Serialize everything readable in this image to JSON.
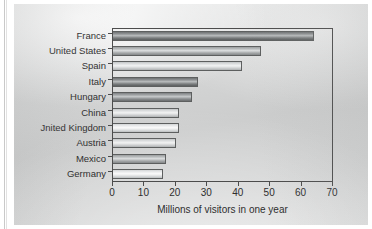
{
  "chart_data": {
    "type": "bar",
    "orientation": "horizontal",
    "title": "",
    "xlabel": "Millions of visitors in one year",
    "ylabel": "",
    "xlim": [
      0,
      70
    ],
    "xticks": [
      0,
      10,
      20,
      30,
      40,
      50,
      60,
      70
    ],
    "grid": false,
    "legend": false,
    "categories": [
      "France",
      "United States",
      "Spain",
      "Italy",
      "Hungary",
      "China",
      "Jnited Kingdom",
      "Austria",
      "Mexico",
      "Germany"
    ],
    "values": [
      64,
      47,
      41,
      27,
      25,
      21,
      21,
      20,
      17,
      16
    ],
    "bar_shades": [
      "d1",
      "m1",
      "l1",
      "d1",
      "d2",
      "l1",
      "l2",
      "l1",
      "m1",
      "l2"
    ]
  },
  "axis": {
    "x_tick_labels": [
      "0",
      "10",
      "20",
      "30",
      "40",
      "50",
      "60",
      "70"
    ],
    "x_title": "Millions of visitors in one year"
  },
  "colors": {
    "axis_line": "#4c4c4c",
    "text": "#2e2e2e",
    "paper": "#d5d6d6"
  }
}
